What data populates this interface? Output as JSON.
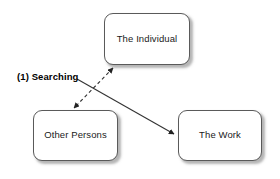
{
  "diagram": {
    "background_color": "#ffffff",
    "node_fill": "#ffffff",
    "node_border_color": "#5a5a5a",
    "shadow_color": "#787878",
    "edge_color": "#333333",
    "nodes": [
      {
        "id": "the-individual",
        "label": "The Individual",
        "x": 104,
        "y": 13,
        "width": 86,
        "height": 52
      },
      {
        "id": "other-persons",
        "label": "Other Persons",
        "x": 33,
        "y": 110,
        "width": 85,
        "height": 51
      },
      {
        "id": "the-work",
        "label": "The Work",
        "x": 178,
        "y": 110,
        "width": 84,
        "height": 51
      }
    ],
    "edges": [
      {
        "id": "individual-other-persons",
        "style": "dashed",
        "arrowheads": "both",
        "from": "the-individual",
        "to": "other-persons",
        "x1": 113,
        "y1": 68,
        "x2": 74,
        "y2": 108
      },
      {
        "id": "individual-the-work",
        "style": "solid",
        "arrowheads": "end",
        "from": "the-individual",
        "to": "the-work",
        "x1": 77,
        "y1": 79,
        "x2": 174,
        "y2": 134
      }
    ],
    "labels": [
      {
        "id": "searching-label",
        "text": "(1) Searching",
        "x": 17,
        "y": 71,
        "bold": true
      }
    ]
  }
}
